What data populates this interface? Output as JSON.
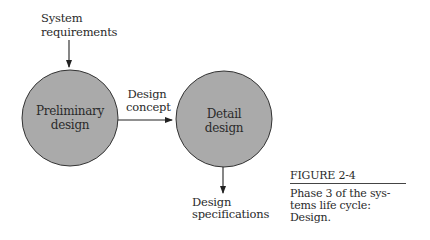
{
  "diagram": {
    "input": {
      "line1": "System",
      "line2": "requirements"
    },
    "nodes": [
      {
        "id": "preliminary",
        "line1": "Preliminary",
        "line2": "design",
        "fill": "#a9a9a9"
      },
      {
        "id": "detail",
        "line1": "Detail",
        "line2": "design",
        "fill": "#a9a9a9"
      }
    ],
    "edge_label": {
      "line1": "Design",
      "line2": "concept"
    },
    "output": {
      "line1": "Design",
      "line2": "specifications"
    }
  },
  "caption": {
    "title": "FIGURE 2-4",
    "body": "Phase 3 of the sys-\ntems life cycle:\nDesign."
  }
}
